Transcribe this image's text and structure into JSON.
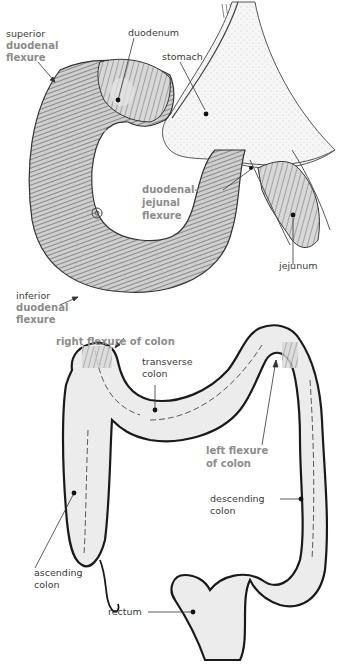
{
  "figure": {
    "type": "anatomical-illustration",
    "panels": [
      {
        "name": "duodenum-panel",
        "labels": {
          "superior_duodenal_flexure": {
            "prefix": "superior",
            "lines": [
              "duodenal",
              "flexure"
            ]
          },
          "duodenum": "duodenum",
          "stomach": "stomach",
          "duodenal_jejunal_flexure": {
            "lines": [
              "duodenal-",
              "jejunal",
              "flexure"
            ]
          },
          "jejunum": "jejunum",
          "inferior_duodenal_flexure": {
            "prefix": "inferior",
            "lines": [
              "duodenal",
              "flexure"
            ]
          }
        }
      },
      {
        "name": "colon-panel",
        "labels": {
          "right_flexure_of_colon": "right flexure of colon",
          "transverse_colon": {
            "lines": [
              "transverse",
              "colon"
            ]
          },
          "left_flexure_of_colon": {
            "lines": [
              "left flexure",
              "of colon"
            ]
          },
          "descending_colon": {
            "lines": [
              "descending",
              "colon"
            ]
          },
          "ascending_colon": {
            "lines": [
              "ascending",
              "colon"
            ]
          },
          "rectum": "rectum"
        }
      }
    ]
  },
  "colors": {
    "emphasis_label": "#8c8c8c",
    "regular_label": "#3a3a3a",
    "outline": "#1a1a1a",
    "colon_fill": "#ececec",
    "stomach_fill": "#f4f4f4",
    "duodenum_fill": "#bdbdbd"
  }
}
